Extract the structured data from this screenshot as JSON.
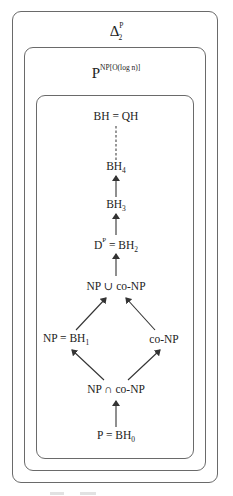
{
  "diagram": {
    "outer_box": {
      "title_base": "Δ",
      "title_sup": "P",
      "title_sub": "2"
    },
    "middle_box": {
      "title_base": "P",
      "title_sup": "NP[O(log n)]"
    },
    "inner_box": {
      "nodes": [
        {
          "id": "bh-qh",
          "text": "BH = QH"
        },
        {
          "id": "bh4",
          "base": "BH",
          "sub": "4"
        },
        {
          "id": "bh3",
          "base": "BH",
          "sub": "3"
        },
        {
          "id": "dp-bh2",
          "base1": "D",
          "sup1": "P",
          "mid": " = BH",
          "sub": "2"
        },
        {
          "id": "np-union-conp",
          "text": "NP ∪ co-NP"
        },
        {
          "id": "np-bh1",
          "base": "NP = BH",
          "sub": "1"
        },
        {
          "id": "conp",
          "text": "co-NP"
        },
        {
          "id": "np-intersect-conp",
          "text": "NP ∩ co-NP"
        },
        {
          "id": "p-bh0",
          "base": "P = BH",
          "sub": "0"
        }
      ],
      "edges": [
        {
          "from": "bh4",
          "to": "bh-qh",
          "style": "dashed"
        },
        {
          "from": "bh3",
          "to": "bh4",
          "style": "arrow"
        },
        {
          "from": "dp-bh2",
          "to": "bh3",
          "style": "arrow"
        },
        {
          "from": "np-union-conp",
          "to": "dp-bh2",
          "style": "arrow"
        },
        {
          "from": "np-bh1",
          "to": "np-union-conp",
          "style": "arrow"
        },
        {
          "from": "conp",
          "to": "np-union-conp",
          "style": "arrow"
        },
        {
          "from": "np-intersect-conp",
          "to": "np-bh1",
          "style": "arrow"
        },
        {
          "from": "np-intersect-conp",
          "to": "conp",
          "style": "arrow"
        },
        {
          "from": "p-bh0",
          "to": "np-intersect-conp",
          "style": "arrow"
        }
      ]
    },
    "colors": {
      "box_stroke": "#6a6a6a",
      "edge_stroke": "#333333",
      "text": "#222222"
    }
  }
}
